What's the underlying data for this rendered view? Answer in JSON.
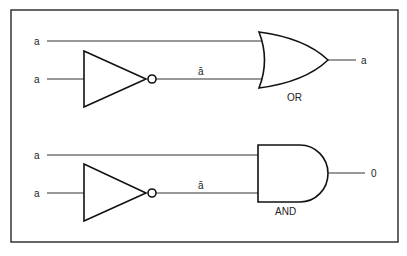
{
  "diagram": {
    "circuit_or": {
      "input_top_label": "a",
      "input_bottom_label": "a",
      "not_output_label": "ā",
      "gate_label": "OR",
      "output_label": "a"
    },
    "circuit_and": {
      "input_top_label": "a",
      "input_bottom_label": "a",
      "not_output_label": "ā",
      "gate_label": "AND",
      "output_label": "0"
    }
  }
}
